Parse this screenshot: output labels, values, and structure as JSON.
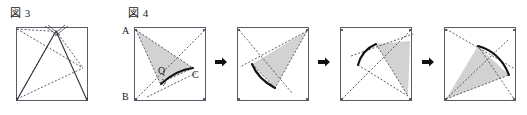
{
  "page": {
    "width": 527,
    "height": 115,
    "background": "#ffffff"
  },
  "captions": {
    "fig3": "図 3",
    "fig4": "図 4"
  },
  "vertex_labels": {
    "A": "A",
    "B": "B",
    "C": "C",
    "Q": "Q"
  },
  "colors": {
    "stroke": "#3a3a46",
    "stroke_dark": "#1a1a1a",
    "fill_gray": "#d2d2d2",
    "fill_gray_edge": "#b8b8b8",
    "arrow": "#111111",
    "square_border": "#5a5a66",
    "text": "#1a1a1a"
  },
  "figure3": {
    "name": "figure-3-square-with-folded-triangle",
    "square": {
      "x": 16,
      "y": 27,
      "w": 72,
      "h": 74
    },
    "apex": {
      "x": 56,
      "y": 31
    },
    "solid_lines": [
      {
        "from": [
          56,
          31
        ],
        "to": [
          17,
          99
        ]
      },
      {
        "from": [
          56,
          31
        ],
        "to": [
          86,
          99
        ]
      }
    ],
    "dotted_lines": [
      {
        "from": [
          17,
          29
        ],
        "to": [
          83,
          68
        ]
      },
      {
        "from": [
          56,
          31
        ],
        "to": [
          83,
          68
        ]
      },
      {
        "from": [
          56,
          31
        ],
        "to": [
          17,
          99
        ]
      },
      {
        "from": [
          17,
          99
        ],
        "to": [
          83,
          68
        ]
      },
      {
        "from": [
          17,
          29
        ],
        "to": [
          56,
          31
        ]
      }
    ],
    "arc_marks": 4
  },
  "figure4": {
    "name": "figure-4-rotation-sequence",
    "panel_count": 5,
    "arrow_count": 4,
    "panels": [
      {
        "id": "panel-1",
        "label": "initial-position",
        "square": {
          "x": 134,
          "y": 27,
          "w": 72,
          "h": 74
        },
        "shaded_triangle": [
          [
            136,
            30
          ],
          [
            192,
            68
          ],
          [
            168,
            77
          ]
        ],
        "arc": {
          "start": [
            192,
            68
          ],
          "end": [
            161,
            84
          ],
          "bulge": 6
        },
        "dotted_lines": [
          {
            "from": [
              136,
              30
            ],
            "to": [
              192,
              68
            ]
          },
          {
            "from": [
              136,
              30
            ],
            "to": [
              168,
              77
            ]
          },
          {
            "from": [
              136,
              99
            ],
            "to": [
              204,
              31
            ]
          },
          {
            "from": [
              168,
              77
            ],
            "to": [
              192,
              68
            ]
          },
          {
            "from": [
              136,
              30
            ],
            "to": [
              161,
              84
            ]
          }
        ],
        "vertex_labels": [
          {
            "text": "A",
            "x": 122,
            "y": 26
          },
          {
            "text": "B",
            "x": 122,
            "y": 92
          },
          {
            "text": "C",
            "x": 192,
            "y": 70
          },
          {
            "text": "Q",
            "x": 160,
            "y": 68
          }
        ],
        "right_angle_mark": {
          "x": 165,
          "y": 78
        }
      },
      {
        "id": "panel-2",
        "label": "rotated-step-1",
        "square": {
          "x": 237,
          "y": 27,
          "w": 72,
          "h": 74
        },
        "shaded_triangle": [
          [
            307,
            31
          ],
          [
            252,
            64
          ],
          [
            275,
            87
          ]
        ],
        "arc": {
          "start": [
            252,
            64
          ],
          "end": [
            275,
            87
          ],
          "bulge": 6
        },
        "dotted_lines": [
          {
            "from": [
              239,
              30
            ],
            "to": [
              290,
              92
            ]
          },
          {
            "from": [
              307,
              31
            ],
            "to": [
              240,
              66
            ]
          },
          {
            "from": [
              307,
              31
            ],
            "to": [
              275,
              87
            ]
          },
          {
            "from": [
              252,
              64
            ],
            "to": [
              275,
              87
            ]
          }
        ]
      },
      {
        "id": "panel-3",
        "label": "rotated-step-2",
        "square": {
          "x": 340,
          "y": 27,
          "w": 72,
          "h": 74
        },
        "shaded_triangle": [
          [
            375,
            43
          ],
          [
            410,
            40
          ],
          [
            407,
            95
          ]
        ],
        "arc": {
          "start": [
            358,
            64
          ],
          "end": [
            375,
            43
          ],
          "bulge": 6
        },
        "dotted_lines": [
          {
            "from": [
              342,
              99
            ],
            "to": [
              412,
              29
            ]
          },
          {
            "from": [
              352,
              55
            ],
            "to": [
              412,
              34
            ]
          },
          {
            "from": [
              358,
              64
            ],
            "to": [
              407,
              95
            ]
          },
          {
            "from": [
              375,
              43
            ],
            "to": [
              407,
              95
            ]
          }
        ]
      },
      {
        "id": "panel-4",
        "label": "rotated-step-3",
        "square": {
          "x": 444,
          "y": 27,
          "w": 72,
          "h": 74
        },
        "shaded_triangle": [
          [
            478,
            45
          ],
          [
            446,
            99
          ],
          [
            508,
            74
          ]
        ],
        "arc": {
          "start": [
            478,
            45
          ],
          "end": [
            508,
            74
          ],
          "bulge": 7
        },
        "dotted_lines": [
          {
            "from": [
              446,
              29
            ],
            "to": [
              514,
              68
            ]
          },
          {
            "from": [
              446,
              99
            ],
            "to": [
              508,
              38
            ]
          },
          {
            "from": [
              446,
              99
            ],
            "to": [
              508,
              74
            ]
          },
          {
            "from": [
              478,
              45
            ],
            "to": [
              514,
              99
            ]
          }
        ]
      }
    ],
    "arrows": [
      {
        "x": 216,
        "y": 62
      },
      {
        "x": 319,
        "y": 62
      },
      {
        "x": 423,
        "y": 62
      },
      {
        "x": 527,
        "y": 62
      }
    ]
  }
}
